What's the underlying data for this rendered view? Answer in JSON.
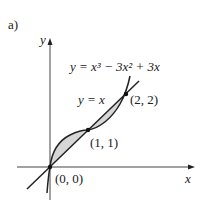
{
  "figure": {
    "panel_label": "a)",
    "y_axis_label": "y",
    "x_axis_label": "x",
    "curve_label_cubic": "y = x³ − 3x² + 3x",
    "curve_label_line": "y = x",
    "points": [
      {
        "label": "(0, 0)",
        "x": 0,
        "y": 0
      },
      {
        "label": "(1, 1)",
        "x": 1,
        "y": 1
      },
      {
        "label": "(2, 2)",
        "x": 2,
        "y": 2
      }
    ],
    "shading": "regions between y = x and y = x³ − 3x² + 3x from x=0 to x=2",
    "colors": {
      "ink": "#222222",
      "shade": "#d6d6d6"
    }
  }
}
